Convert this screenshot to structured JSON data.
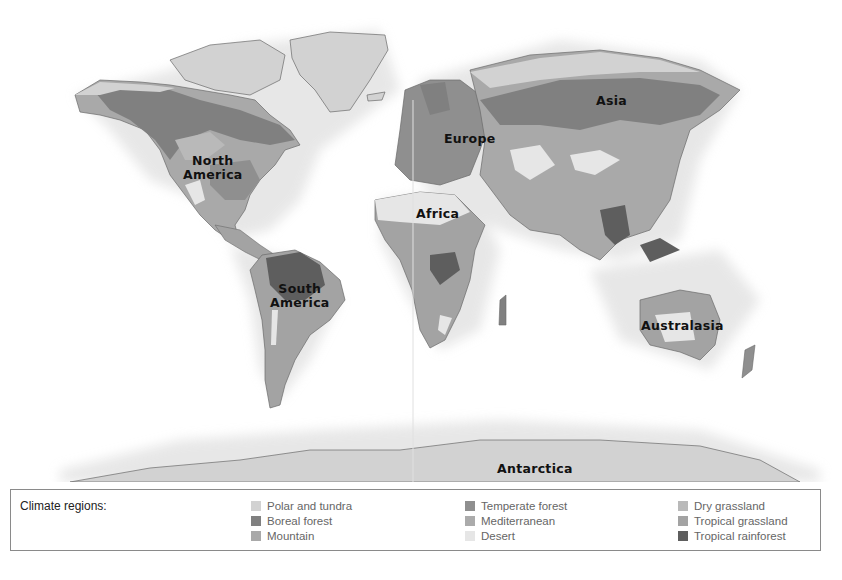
{
  "map": {
    "labels": {
      "north_america": "North\nAmerica",
      "north_america_l1": "North",
      "north_america_l2": "America",
      "south_america_l1": "South",
      "south_america_l2": "America",
      "europe": "Europe",
      "asia": "Asia",
      "africa": "Africa",
      "australasia": "Australasia",
      "antarctica": "Antarctica"
    }
  },
  "legend": {
    "title": "Climate regions:",
    "items": [
      {
        "label": "Polar and tundra",
        "color": "#d2d2d2"
      },
      {
        "label": "Boreal forest",
        "color": "#808080"
      },
      {
        "label": "Mountain",
        "color": "#a9a9a9"
      },
      {
        "label": "Temperate forest",
        "color": "#8f8f8f"
      },
      {
        "label": "Mediterranean",
        "color": "#ababab"
      },
      {
        "label": "Desert",
        "color": "#e6e6e6"
      },
      {
        "label": "Dry grassland",
        "color": "#b9b9b9"
      },
      {
        "label": "Tropical grassland",
        "color": "#a3a3a3"
      },
      {
        "label": "Tropical rainforest",
        "color": "#5e5e5e"
      }
    ]
  }
}
